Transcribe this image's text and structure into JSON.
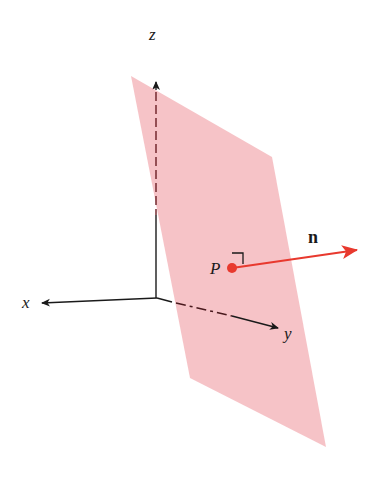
{
  "diagram": {
    "type": "3d-plane-normal-vector",
    "labels": {
      "z_axis": "z",
      "x_axis": "x",
      "y_axis": "y",
      "point": "P",
      "normal_vector": "n"
    },
    "colors": {
      "plane_fill": "#f4b9bd",
      "normal_vector": "#e8392e",
      "point": "#e8392e",
      "axes": "#1a1a1a"
    },
    "geometry": {
      "plane_corners": [
        [
          131,
          76
        ],
        [
          272,
          157
        ],
        [
          326,
          447
        ],
        [
          190,
          378
        ]
      ],
      "origin": [
        157,
        298
      ],
      "z_axis_end": [
        156,
        82
      ],
      "x_axis_end": [
        40,
        303
      ],
      "y_axis_end": [
        280,
        329
      ],
      "point_P": [
        232,
        268
      ],
      "normal_end": [
        358,
        250
      ]
    }
  }
}
